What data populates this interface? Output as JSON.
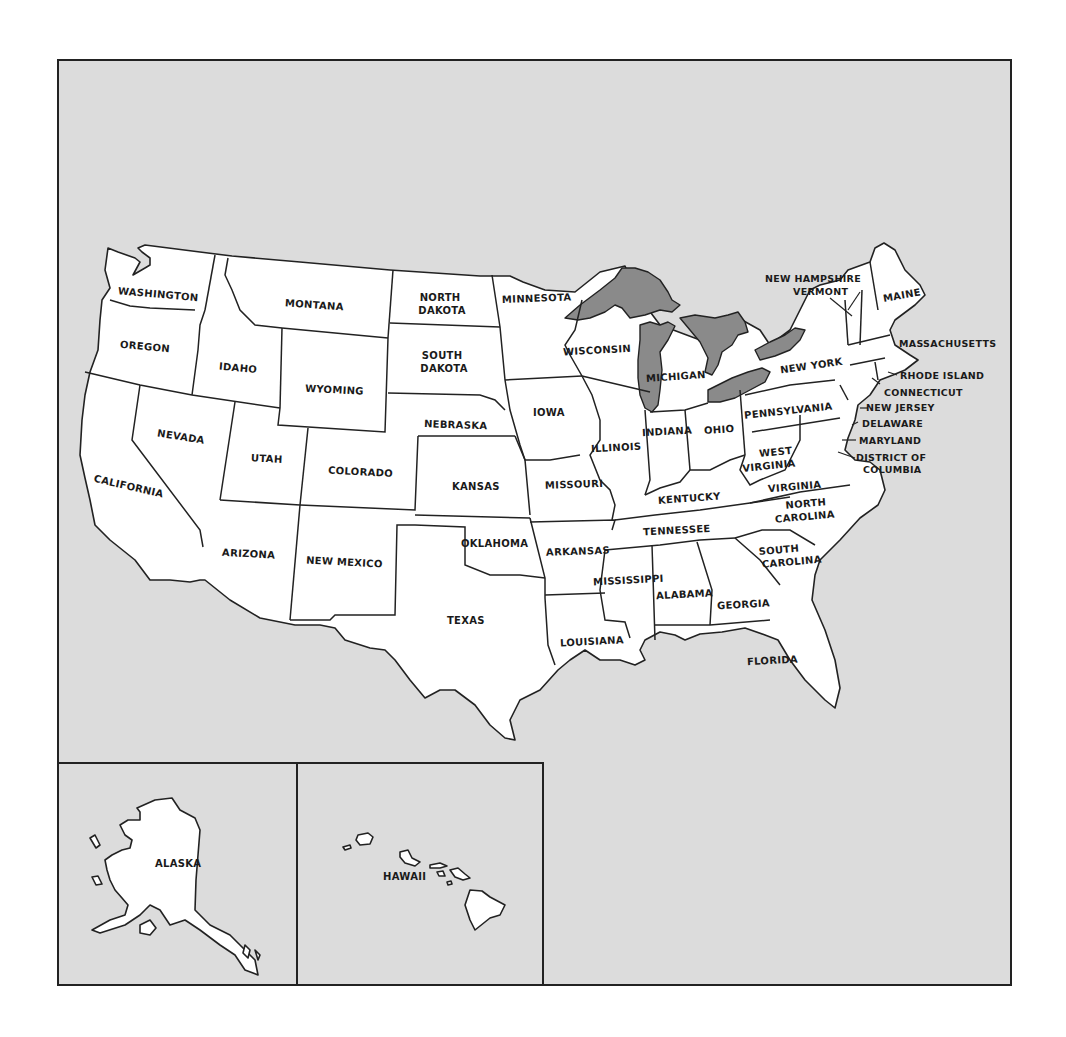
{
  "map": {
    "title": "",
    "colors": {
      "background": "#dcdcdc",
      "land": "#ffffff",
      "water": "#8a8a8a",
      "outline": "#222222"
    },
    "states": [
      {
        "id": "washington",
        "label": "WASHINGTON"
      },
      {
        "id": "oregon",
        "label": "OREGON"
      },
      {
        "id": "california",
        "label": "CALIFORNIA"
      },
      {
        "id": "idaho",
        "label": "IDAHO"
      },
      {
        "id": "nevada",
        "label": "NEVADA"
      },
      {
        "id": "montana",
        "label": "MONTANA"
      },
      {
        "id": "wyoming",
        "label": "WYOMING"
      },
      {
        "id": "utah",
        "label": "UTAH"
      },
      {
        "id": "arizona",
        "label": "ARIZONA"
      },
      {
        "id": "colorado",
        "label": "COLORADO"
      },
      {
        "id": "new-mexico",
        "label": "NEW MEXICO"
      },
      {
        "id": "north-dakota",
        "label": "NORTH DAKOTA",
        "lines": [
          "NORTH",
          "DAKOTA"
        ]
      },
      {
        "id": "south-dakota",
        "label": "SOUTH DAKOTA",
        "lines": [
          "SOUTH",
          "DAKOTA"
        ]
      },
      {
        "id": "nebraska",
        "label": "NEBRASKA"
      },
      {
        "id": "kansas",
        "label": "KANSAS"
      },
      {
        "id": "oklahoma",
        "label": "OKLAHOMA"
      },
      {
        "id": "texas",
        "label": "TEXAS"
      },
      {
        "id": "minnesota",
        "label": "MINNESOTA"
      },
      {
        "id": "iowa",
        "label": "IOWA"
      },
      {
        "id": "missouri",
        "label": "MISSOURI"
      },
      {
        "id": "arkansas",
        "label": "ARKANSAS"
      },
      {
        "id": "louisiana",
        "label": "LOUISIANA"
      },
      {
        "id": "wisconsin",
        "label": "WISCONSIN"
      },
      {
        "id": "illinois",
        "label": "ILLINOIS"
      },
      {
        "id": "michigan",
        "label": "MICHIGAN"
      },
      {
        "id": "indiana",
        "label": "INDIANA"
      },
      {
        "id": "ohio",
        "label": "OHIO"
      },
      {
        "id": "kentucky",
        "label": "KENTUCKY"
      },
      {
        "id": "tennessee",
        "label": "TENNESSEE"
      },
      {
        "id": "mississippi",
        "label": "MISSISSIPPI"
      },
      {
        "id": "alabama",
        "label": "ALABAMA"
      },
      {
        "id": "georgia",
        "label": "GEORGIA"
      },
      {
        "id": "florida",
        "label": "FLORIDA"
      },
      {
        "id": "south-carolina",
        "label": "SOUTH CAROLINA",
        "lines": [
          "SOUTH",
          "CAROLINA"
        ]
      },
      {
        "id": "north-carolina",
        "label": "NORTH CAROLINA",
        "lines": [
          "NORTH",
          "CAROLINA"
        ]
      },
      {
        "id": "virginia",
        "label": "VIRGINIA"
      },
      {
        "id": "west-virginia",
        "label": "WEST VIRGINIA",
        "lines": [
          "WEST",
          "VIRGINIA"
        ]
      },
      {
        "id": "pennsylvania",
        "label": "PENNSYLVANIA"
      },
      {
        "id": "new-york",
        "label": "NEW YORK"
      },
      {
        "id": "vermont",
        "label": "VERMONT"
      },
      {
        "id": "new-hampshire",
        "label": "NEW HAMPSHIRE"
      },
      {
        "id": "maine",
        "label": "MAINE"
      },
      {
        "id": "massachusetts",
        "label": "MASSACHUSETTS"
      },
      {
        "id": "rhode-island",
        "label": "RHODE ISLAND"
      },
      {
        "id": "connecticut",
        "label": "CONNECTICUT"
      },
      {
        "id": "new-jersey",
        "label": "NEW JERSEY"
      },
      {
        "id": "delaware",
        "label": "DELAWARE"
      },
      {
        "id": "maryland",
        "label": "MARYLAND"
      },
      {
        "id": "district-of-columbia",
        "label": "DISTRICT OF COLUMBIA",
        "lines": [
          "DISTRICT OF",
          "COLUMBIA"
        ]
      }
    ],
    "insets": [
      {
        "id": "alaska",
        "label": "ALASKA"
      },
      {
        "id": "hawaii",
        "label": "HAWAII"
      }
    ]
  }
}
